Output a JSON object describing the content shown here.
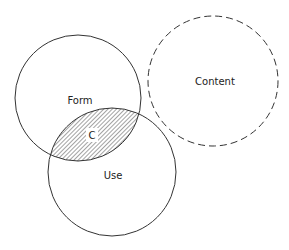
{
  "diagram": {
    "type": "venn",
    "circles": [
      {
        "id": "form",
        "label": "Form",
        "cx": 78,
        "cy": 98,
        "r": 63,
        "style": "solid"
      },
      {
        "id": "use",
        "label": "Use",
        "cx": 112,
        "cy": 172,
        "r": 64,
        "style": "solid"
      },
      {
        "id": "content",
        "label": "Content",
        "cx": 213,
        "cy": 81,
        "r": 65,
        "style": "dashed"
      }
    ],
    "intersection": {
      "label": "C",
      "between": [
        "form",
        "use"
      ],
      "fill": "hatched"
    }
  },
  "labels": {
    "form": "Form",
    "use": "Use",
    "content": "Content",
    "intersection": "C"
  },
  "colors": {
    "stroke": "#333333",
    "hatch": "#555555",
    "background": "#ffffff"
  }
}
